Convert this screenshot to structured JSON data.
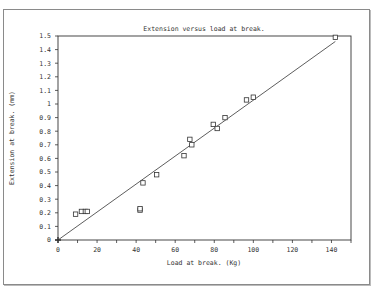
{
  "chart_data": {
    "type": "scatter",
    "title": "Extension versus load at break.",
    "xlabel": "Load at break. (Kg)",
    "ylabel": "Extension at break. (mm)",
    "xlim": [
      0,
      150
    ],
    "ylim": [
      0,
      1.5
    ],
    "x_ticks": [
      "0",
      "20",
      "40",
      "60",
      "80",
      "100",
      "120",
      "140"
    ],
    "y_ticks": [
      "0",
      "0.1",
      "0.2",
      "0.3",
      "0.4",
      "0.5",
      "0.6",
      "0.7",
      "0.8",
      "0.9",
      "1",
      "1.1",
      "1.2",
      "1.3",
      "1.4",
      "1.5"
    ],
    "grid": false,
    "legend": null,
    "series": [
      {
        "name": "measurements",
        "marker": "open-square",
        "points": [
          [
            9,
            0.19
          ],
          [
            12,
            0.21
          ],
          [
            14,
            0.21
          ],
          [
            15,
            0.21
          ],
          [
            42,
            0.22
          ],
          [
            42,
            0.23
          ],
          [
            43.5,
            0.42
          ],
          [
            50.5,
            0.48
          ],
          [
            64.5,
            0.62
          ],
          [
            67.5,
            0.74
          ],
          [
            68.5,
            0.7
          ],
          [
            79.5,
            0.85
          ],
          [
            81.5,
            0.82
          ],
          [
            85.5,
            0.9
          ],
          [
            96.5,
            1.03
          ],
          [
            100,
            1.05
          ],
          [
            142,
            1.49
          ]
        ]
      },
      {
        "name": "fit line",
        "type": "line",
        "points": [
          [
            0,
            0
          ],
          [
            142,
            1.46
          ]
        ]
      }
    ]
  }
}
